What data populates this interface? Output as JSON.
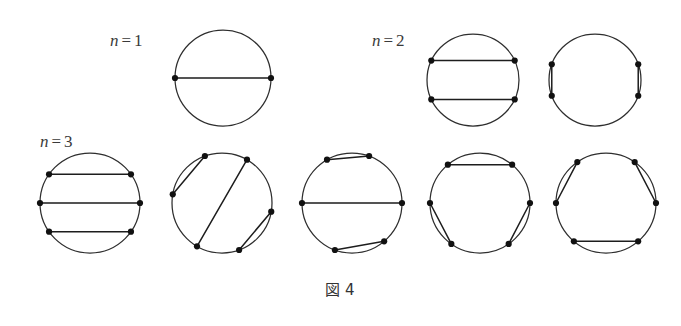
{
  "figure": {
    "caption": "図 4",
    "caption_label": "図",
    "caption_number": "4",
    "background_color": "#ffffff",
    "stroke_color": "#2e2e2e",
    "chord_color": "#1d1d1d",
    "vertex_color": "#111111"
  },
  "groups": [
    {
      "id": "n1",
      "label_variable": "n",
      "label_relation": "=",
      "label_value": "1",
      "label_full": "n = 1",
      "label_x": 110,
      "label_y": 46,
      "diagram_count": 1
    },
    {
      "id": "n2",
      "label_variable": "n",
      "label_relation": "=",
      "label_value": "2",
      "label_full": "n = 2",
      "label_x": 372,
      "label_y": 46,
      "diagram_count": 2
    },
    {
      "id": "n3",
      "label_variable": "n",
      "label_relation": "=",
      "label_value": "3",
      "label_full": "n = 3",
      "label_x": 40,
      "label_y": 147,
      "diagram_count": 5
    }
  ],
  "chart_data": {
    "type": "diagram",
    "title": "図 4",
    "vertex_radius": 3.1,
    "diagrams": [
      {
        "name": "n1-diagram-1",
        "group": "n1",
        "cx": 223,
        "cy": 78,
        "r": 48,
        "point_count": 2,
        "vertex_angles": [
          180,
          0
        ],
        "chords": [
          [
            0,
            1
          ]
        ]
      },
      {
        "name": "n2-diagram-1",
        "group": "n2",
        "cx": 473,
        "cy": 80,
        "r": 46,
        "point_count": 4,
        "vertex_angles": [
          155,
          25,
          335,
          205
        ],
        "chords": [
          [
            0,
            1
          ],
          [
            2,
            3
          ]
        ]
      },
      {
        "name": "n2-diagram-2",
        "group": "n2",
        "cx": 595,
        "cy": 80,
        "r": 46,
        "point_count": 4,
        "vertex_angles": [
          160,
          20,
          340,
          200
        ],
        "chords": [
          [
            0,
            3
          ],
          [
            1,
            2
          ]
        ]
      },
      {
        "name": "n3-diagram-1",
        "group": "n3",
        "cx": 90,
        "cy": 203,
        "r": 50,
        "point_count": 6,
        "vertex_angles": [
          145,
          35,
          0,
          325,
          215,
          180
        ],
        "chords": [
          [
            0,
            1
          ],
          [
            5,
            2
          ],
          [
            4,
            3
          ]
        ]
      },
      {
        "name": "n3-diagram-2",
        "group": "n3",
        "cx": 222,
        "cy": 203,
        "r": 50,
        "point_count": 6,
        "vertex_angles": [
          110,
          60,
          350,
          290,
          240,
          170
        ],
        "chords": [
          [
            0,
            5
          ],
          [
            1,
            4
          ],
          [
            2,
            3
          ]
        ]
      },
      {
        "name": "n3-diagram-3",
        "group": "n3",
        "cx": 352,
        "cy": 203,
        "r": 50,
        "point_count": 6,
        "vertex_angles": [
          120,
          70,
          0,
          310,
          250,
          180
        ],
        "chords": [
          [
            0,
            1
          ],
          [
            5,
            2
          ],
          [
            4,
            3
          ]
        ]
      },
      {
        "name": "n3-diagram-4",
        "group": "n3",
        "cx": 480,
        "cy": 203,
        "r": 50,
        "point_count": 6,
        "vertex_angles": [
          130,
          50,
          0,
          305,
          235,
          180
        ],
        "chords": [
          [
            0,
            1
          ],
          [
            5,
            4
          ],
          [
            2,
            3
          ]
        ]
      },
      {
        "name": "n3-diagram-5",
        "group": "n3",
        "cx": 606,
        "cy": 203,
        "r": 50,
        "point_count": 6,
        "vertex_angles": [
          125,
          55,
          0,
          310,
          230,
          180
        ],
        "chords": [
          [
            0,
            5
          ],
          [
            1,
            2
          ],
          [
            4,
            3
          ]
        ]
      }
    ]
  },
  "caption_position": {
    "x": 340,
    "y": 295
  }
}
